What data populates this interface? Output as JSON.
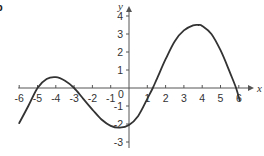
{
  "figure": {
    "part_label": "b"
  },
  "chart_data": {
    "type": "line",
    "title": "",
    "xlabel": "x",
    "ylabel": "y",
    "xlim": [
      -6,
      6
    ],
    "ylim": [
      -3,
      4
    ],
    "x_ticks": [
      -6,
      -5,
      -4,
      -3,
      -2,
      -1,
      0,
      1,
      2,
      3,
      4,
      5,
      6
    ],
    "x_tick_labels": [
      "-6",
      "-5",
      "-4",
      "-3",
      "-2",
      "-1",
      "0",
      "1",
      "2",
      "3",
      "4",
      "5",
      "6"
    ],
    "y_ticks": [
      -3,
      -2,
      -1,
      1,
      2,
      3,
      4
    ],
    "y_tick_labels": [
      "-3",
      "-2",
      "-1",
      "1",
      "2",
      "3",
      "4"
    ],
    "origin_label": "0",
    "grid": false,
    "legend": null,
    "series": [
      {
        "name": "f(x)",
        "color": "#333333",
        "x": [
          -6.0,
          -5.5,
          -5.0,
          -4.5,
          -4.0,
          -3.5,
          -3.0,
          -2.5,
          -2.0,
          -1.5,
          -1.0,
          -0.5,
          0.0,
          0.5,
          1.0,
          1.3,
          1.5,
          2.0,
          2.5,
          3.0,
          3.5,
          3.8,
          4.0,
          4.5,
          5.0,
          5.5,
          5.85,
          6.05
        ],
        "y": [
          -1.95,
          -1.0,
          0.0,
          0.5,
          0.6,
          0.4,
          0.0,
          -0.6,
          -1.2,
          -1.75,
          -2.1,
          -2.2,
          -2.05,
          -1.55,
          -0.6,
          0.0,
          0.45,
          1.6,
          2.6,
          3.2,
          3.48,
          3.5,
          3.45,
          3.0,
          2.1,
          0.9,
          0.0,
          -0.7
        ]
      }
    ],
    "key_points": {
      "local_max": [
        -4,
        0.6
      ],
      "local_min": [
        -0.5,
        -2.2
      ],
      "global_max": [
        3.8,
        3.5
      ],
      "roots": [
        -5,
        -3,
        1.3,
        5.85
      ]
    }
  }
}
